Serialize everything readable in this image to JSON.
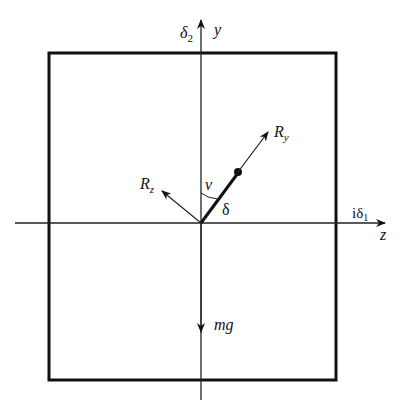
{
  "diagram": {
    "labels": {
      "delta2": "δ",
      "delta2_sub": "2",
      "y_axis": "y",
      "z_axis": "z",
      "i_delta1": "iδ",
      "i_delta1_sub": "1",
      "R_y": "R",
      "R_y_sub": "y",
      "R_z": "R",
      "R_z_sub": "z",
      "nu": "ν",
      "delta": "δ",
      "mg": "mg"
    },
    "elements": {
      "frame": "rectangle box",
      "horizontal_axis": "z / iδ1 axis with arrow",
      "vertical_axis": "y / δ2 axis with arrow",
      "rod": "thick line from origin with dot at end",
      "force_Ry": "arrow along rod direction",
      "force_Rz": "arrow perpendicular, upper-left",
      "force_mg": "downward arrow",
      "angle_nu": "arc between y axis and rod"
    },
    "colors": {
      "stroke": "#111111",
      "background": "#ffffff"
    }
  }
}
